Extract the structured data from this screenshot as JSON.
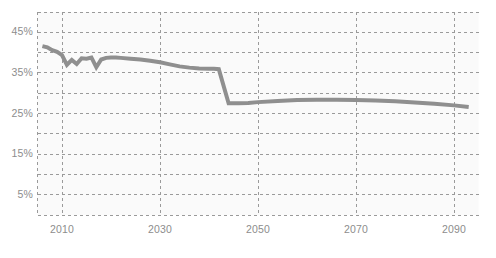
{
  "chart_data": {
    "type": "line",
    "title": "",
    "subtitle": "",
    "xlabel": "",
    "ylabel": "",
    "xlim": [
      2005,
      2095
    ],
    "ylim": [
      0,
      50
    ],
    "grid": true,
    "grid_style": "dashed",
    "legend": "none",
    "y_ticks": [
      {
        "value": 45,
        "label": "45%"
      },
      {
        "value": 35,
        "label": "35%"
      },
      {
        "value": 25,
        "label": "25%"
      },
      {
        "value": 15,
        "label": "15%"
      },
      {
        "value": 5,
        "label": "5%"
      }
    ],
    "y_gridlines": [
      5,
      10,
      15,
      20,
      25,
      30,
      35,
      40,
      45,
      50
    ],
    "x_ticks": [
      {
        "value": 2010,
        "label": "2010"
      },
      {
        "value": 2030,
        "label": "2030"
      },
      {
        "value": 2050,
        "label": "2050"
      },
      {
        "value": 2070,
        "label": "2070"
      },
      {
        "value": 2090,
        "label": "2090"
      }
    ],
    "x_gridlines": [
      2010,
      2030,
      2050,
      2070,
      2090
    ],
    "series": [
      {
        "name": "series-1",
        "color": "#8f8f8f",
        "line_width": 4,
        "x": [
          2006,
          2007,
          2008,
          2009,
          2010,
          2011,
          2012,
          2013,
          2014,
          2015,
          2016,
          2017,
          2018,
          2019,
          2020,
          2021,
          2022,
          2024,
          2026,
          2028,
          2030,
          2032,
          2034,
          2036,
          2038,
          2040,
          2041,
          2042,
          2044,
          2046,
          2048,
          2050,
          2054,
          2058,
          2062,
          2066,
          2070,
          2074,
          2078,
          2082,
          2086,
          2090,
          2093
        ],
        "values": [
          41.6,
          41.3,
          40.6,
          40.2,
          39.4,
          37.0,
          38.2,
          37.2,
          38.6,
          38.5,
          38.8,
          36.4,
          38.3,
          38.7,
          38.8,
          38.8,
          38.7,
          38.5,
          38.3,
          38.0,
          37.6,
          37.1,
          36.6,
          36.3,
          36.1,
          36.0,
          36.0,
          35.9,
          27.5,
          27.5,
          27.6,
          27.8,
          28.1,
          28.3,
          28.4,
          28.4,
          28.3,
          28.2,
          28.0,
          27.7,
          27.4,
          27.0,
          26.6
        ]
      }
    ]
  },
  "axes": {
    "y_axis_name": "percentage-axis",
    "x_axis_name": "year-axis"
  },
  "style": {
    "background": "#ffffff",
    "plot_background": "#fafafa",
    "grid_color": "#9a9a9a",
    "tick_label_color": "#8d8d8d",
    "line_color": "#8f8f8f"
  }
}
